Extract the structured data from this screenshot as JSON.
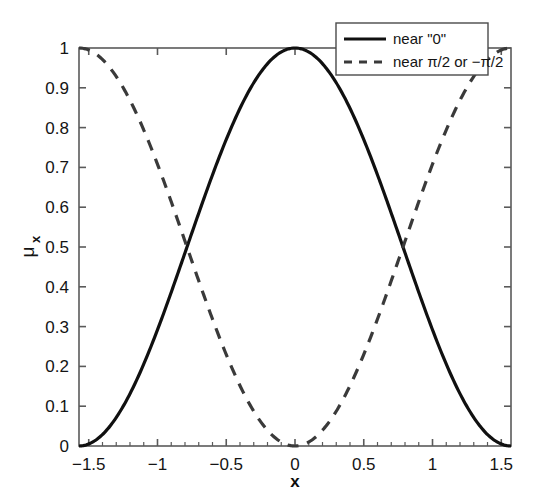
{
  "chart_data": {
    "type": "line",
    "title": "",
    "subtitle": "",
    "xlabel": "x",
    "ylabel_glyph": "μ",
    "ylabel_subscript": "x",
    "ylabel": "μ_x",
    "xlim": [
      -1.5708,
      1.5708
    ],
    "ylim": [
      0,
      1
    ],
    "grid": false,
    "legend_position": "top-right",
    "xticks": [
      -1.5,
      -1,
      -0.5,
      0,
      0.5,
      1,
      1.5
    ],
    "xticklabels": [
      "−1.5",
      "−1",
      "−0.5",
      "0",
      "0.5",
      "1",
      "1.5"
    ],
    "yticks": [
      0,
      0.1,
      0.2,
      0.3,
      0.4,
      0.5,
      0.6,
      0.7,
      0.8,
      0.9,
      1
    ],
    "yticklabels": [
      "0",
      "0.1",
      "0.2",
      "0.3",
      "0.4",
      "0.5",
      "0.6",
      "0.7",
      "0.8",
      "0.9",
      "1"
    ],
    "series": [
      {
        "name": "near \"0\"",
        "style": "solid",
        "color": "#101010",
        "width": 3.2,
        "x": [
          -1.5708,
          -1.4708,
          -1.3708,
          -1.2708,
          -1.1708,
          -1.0708,
          -0.9708,
          -0.8708,
          -0.7708,
          -0.6708,
          -0.5708,
          -0.4708,
          -0.3708,
          -0.2708,
          -0.1708,
          -0.0708,
          0,
          0.0708,
          0.1708,
          0.2708,
          0.3708,
          0.4708,
          0.5708,
          0.6708,
          0.7708,
          0.8708,
          0.9708,
          1.0708,
          1.1708,
          1.2708,
          1.3708,
          1.4708,
          1.5708
        ],
        "y": [
          0.0,
          0.00998,
          0.03947,
          0.08682,
          0.14957,
          0.22452,
          0.30792,
          0.39563,
          0.48329,
          0.56662,
          0.64159,
          0.70469,
          0.75308,
          0.78474,
          0.79853,
          0.79417,
          0.79229,
          0.79417,
          0.79853,
          0.78474,
          0.75308,
          0.70469,
          0.64159,
          0.56662,
          0.48329,
          0.39563,
          0.30792,
          0.22452,
          0.14957,
          0.08682,
          0.03947,
          0.00998,
          0.0
        ]
      },
      {
        "name": "near π/2 or −π/2",
        "style": "dashed",
        "color": "#3a3a3a",
        "width": 3.2,
        "x": [
          -1.5708,
          -1.4708,
          -1.3708,
          -1.2708,
          -1.1708,
          -1.0708,
          -0.9708,
          -0.8708,
          -0.7708,
          -0.6708,
          -0.5708,
          -0.4708,
          -0.3708,
          -0.2708,
          -0.1708,
          -0.0708,
          0,
          0.0708,
          0.1708,
          0.2708,
          0.3708,
          0.4708,
          0.5708,
          0.6708,
          0.7708,
          0.8708,
          0.9708,
          1.0708,
          1.1708,
          1.2708,
          1.3708,
          1.4708,
          1.5708
        ],
        "y": [
          1.0,
          0.99002,
          0.96053,
          0.91318,
          0.85043,
          0.77548,
          0.69208,
          0.60437,
          0.51671,
          0.43338,
          0.35841,
          0.29531,
          0.24692,
          0.21526,
          0.20147,
          0.20583,
          0.20771,
          0.20583,
          0.20147,
          0.21526,
          0.24692,
          0.29531,
          0.35841,
          0.43338,
          0.51671,
          0.60437,
          0.69208,
          0.77548,
          0.85043,
          0.91318,
          0.96053,
          0.99002,
          1.0
        ]
      }
    ],
    "annotations": [
      {
        "note": "curves cross near x = -0.77 and x = 0.79 at mu = 0.355"
      }
    ]
  },
  "legend": {
    "entries": [
      {
        "label": "near \"0\"",
        "style": "solid"
      },
      {
        "label": "near π/2 or −π/2",
        "style": "dashed"
      }
    ]
  },
  "colors": {
    "solid_series": "#101010",
    "dashed_series": "#3a3a3a",
    "axis": "#5a5a5a",
    "background": "#ffffff",
    "text": "#141414"
  }
}
